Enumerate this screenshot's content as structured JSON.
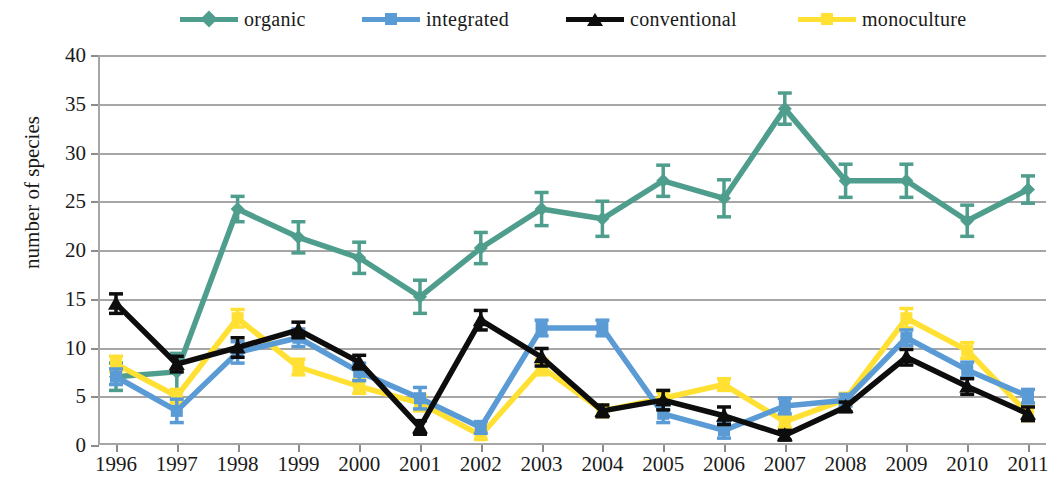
{
  "legend": {
    "items": [
      {
        "label": "organic",
        "color": "#4f9e8d",
        "marker": "diamond"
      },
      {
        "label": "integrated",
        "color": "#5b9bd5",
        "marker": "square"
      },
      {
        "label": "conventional",
        "color": "#0d0d0d",
        "marker": "triangle"
      },
      {
        "label": "monoculture",
        "color": "#ffe033",
        "marker": "square"
      }
    ]
  },
  "axes": {
    "ylabel": "number of species",
    "yticks": [
      "0",
      "5",
      "10",
      "15",
      "20",
      "25",
      "30",
      "35",
      "40"
    ],
    "xlabel": "",
    "xticks": [
      "1996",
      "1997",
      "1998",
      "1999",
      "2000",
      "2001",
      "2002",
      "2003",
      "2004",
      "2005",
      "2006",
      "2007",
      "2008",
      "2009",
      "2010",
      "2011"
    ]
  },
  "chart_data": {
    "type": "line",
    "title": "",
    "xlabel": "",
    "ylabel": "number of species",
    "ylim": [
      0,
      40
    ],
    "ytick_step": 5,
    "grid": true,
    "legend_position": "top",
    "error_bars": true,
    "x": [
      "1996",
      "1997",
      "1998",
      "1999",
      "2000",
      "2001",
      "2002",
      "2003",
      "2004",
      "2005",
      "2006",
      "2007",
      "2008",
      "2009",
      "2010",
      "2011"
    ],
    "series": [
      {
        "name": "organic",
        "color": "#4f9e8d",
        "marker": "diamond",
        "values": [
          7.0,
          7.5,
          24.2,
          21.3,
          19.2,
          15.2,
          20.2,
          24.2,
          23.2,
          27.1,
          25.3,
          34.5,
          27.1,
          27.1,
          23.0,
          26.2
        ],
        "errors": [
          1.4,
          1.9,
          1.3,
          1.6,
          1.6,
          1.7,
          1.6,
          1.7,
          1.8,
          1.6,
          1.9,
          1.6,
          1.7,
          1.7,
          1.6,
          1.4
        ]
      },
      {
        "name": "integrated",
        "color": "#5b9bd5",
        "marker": "square",
        "values": [
          7.0,
          3.5,
          9.5,
          11.0,
          7.5,
          4.8,
          1.8,
          12.0,
          12.0,
          3.2,
          1.5,
          4.0,
          4.6,
          11.0,
          7.7,
          5.0
        ],
        "errors": [
          0.8,
          1.2,
          1.1,
          0.9,
          0.9,
          1.1,
          0.6,
          0.8,
          0.8,
          0.9,
          0.8,
          0.8,
          0.6,
          0.8,
          0.8,
          0.7
        ]
      },
      {
        "name": "conventional",
        "color": "#0d0d0d",
        "marker": "triangle",
        "values": [
          14.5,
          8.3,
          10.0,
          11.8,
          8.5,
          1.8,
          12.8,
          9.0,
          3.5,
          4.6,
          3.0,
          1.0,
          3.9,
          9.0,
          6.0,
          3.2
        ],
        "errors": [
          1.0,
          0.8,
          1.0,
          0.8,
          0.7,
          0.7,
          1.0,
          0.9,
          0.6,
          1.0,
          0.9,
          0.5,
          0.5,
          0.8,
          0.8,
          0.7
        ]
      },
      {
        "name": "monoculture",
        "color": "#ffe033",
        "marker": "square",
        "values": [
          8.3,
          5.0,
          13.0,
          8.0,
          6.0,
          4.3,
          1.0,
          8.0,
          3.5,
          4.8,
          6.2,
          2.4,
          4.7,
          13.0,
          9.7,
          3.2
        ],
        "errors": [
          0.8,
          0.7,
          0.9,
          0.8,
          0.7,
          0.8,
          0.4,
          0.8,
          0.6,
          0.7,
          0.6,
          0.6,
          0.6,
          1.0,
          0.8,
          0.7
        ]
      }
    ]
  }
}
